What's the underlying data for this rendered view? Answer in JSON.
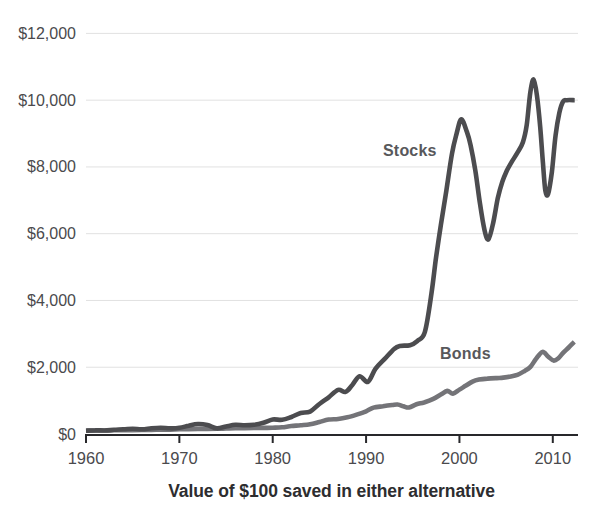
{
  "colors": {
    "background": "#ffffff",
    "stocks_line": "#4c4c4f",
    "bonds_line": "#747478",
    "axis": "#28282b",
    "gridline": "#e1e1e1",
    "tick_text": "#4a4a4d",
    "series_label_text": "#58585b",
    "caption_text": "#2d2d2f"
  },
  "chart_data": {
    "type": "line",
    "title": "Value of $100 saved in either alternative",
    "xlabel": "",
    "ylabel": "",
    "legend_position": "inline-annotations",
    "grid": "horizontal",
    "xlim": [
      1960,
      2012.7
    ],
    "ylim": [
      0,
      12000
    ],
    "x_ticks": [
      {
        "value": 1960,
        "label": "1960"
      },
      {
        "value": 1970,
        "label": "1970"
      },
      {
        "value": 1980,
        "label": "1980"
      },
      {
        "value": 1990,
        "label": "1990"
      },
      {
        "value": 2000,
        "label": "2000"
      },
      {
        "value": 2010,
        "label": "2010"
      }
    ],
    "y_ticks": [
      {
        "value": 0,
        "label": "$0"
      },
      {
        "value": 2000,
        "label": "$2,000"
      },
      {
        "value": 4000,
        "label": "$4,000"
      },
      {
        "value": 6000,
        "label": "$6,000"
      },
      {
        "value": 8000,
        "label": "$8,000"
      },
      {
        "value": 10000,
        "label": "$10,000"
      },
      {
        "value": 12000,
        "label": "$12,000"
      }
    ],
    "series": [
      {
        "name": "Stocks",
        "color": "#4c4c4f",
        "points": [
          [
            1960,
            100
          ],
          [
            1961,
            115
          ],
          [
            1962,
            105
          ],
          [
            1963,
            125
          ],
          [
            1964,
            140
          ],
          [
            1965,
            155
          ],
          [
            1966,
            140
          ],
          [
            1967,
            170
          ],
          [
            1968,
            190
          ],
          [
            1969,
            170
          ],
          [
            1970,
            185
          ],
          [
            1971,
            250
          ],
          [
            1972,
            300
          ],
          [
            1973,
            270
          ],
          [
            1974,
            170
          ],
          [
            1975,
            225
          ],
          [
            1976,
            275
          ],
          [
            1977,
            260
          ],
          [
            1978,
            275
          ],
          [
            1979,
            335
          ],
          [
            1980,
            435
          ],
          [
            1981,
            425
          ],
          [
            1982,
            510
          ],
          [
            1983,
            630
          ],
          [
            1984,
            670
          ],
          [
            1985,
            900
          ],
          [
            1986,
            1100
          ],
          [
            1987,
            1320
          ],
          [
            1987.8,
            1260
          ],
          [
            1988.5,
            1460
          ],
          [
            1989.3,
            1730
          ],
          [
            1990.2,
            1560
          ],
          [
            1991,
            1950
          ],
          [
            1992,
            2250
          ],
          [
            1993,
            2550
          ],
          [
            1993.6,
            2640
          ],
          [
            1994.7,
            2660
          ],
          [
            1995.5,
            2790
          ],
          [
            1996.3,
            3060
          ],
          [
            1997,
            4200
          ],
          [
            1997.5,
            5300
          ],
          [
            1998,
            6250
          ],
          [
            1998.6,
            7300
          ],
          [
            1999.2,
            8400
          ],
          [
            1999.7,
            9000
          ],
          [
            2000.2,
            9430
          ],
          [
            2000.8,
            9050
          ],
          [
            2001.2,
            8650
          ],
          [
            2001.7,
            7900
          ],
          [
            2002.2,
            6900
          ],
          [
            2002.7,
            6100
          ],
          [
            2003.1,
            5830
          ],
          [
            2003.6,
            6300
          ],
          [
            2004.1,
            7050
          ],
          [
            2004.6,
            7560
          ],
          [
            2005.1,
            7900
          ],
          [
            2005.6,
            8150
          ],
          [
            2006.2,
            8420
          ],
          [
            2006.8,
            8740
          ],
          [
            2007.2,
            9250
          ],
          [
            2007.6,
            10250
          ],
          [
            2007.95,
            10620
          ],
          [
            2008.3,
            10150
          ],
          [
            2008.65,
            9200
          ],
          [
            2008.95,
            8100
          ],
          [
            2009.2,
            7300
          ],
          [
            2009.5,
            7190
          ],
          [
            2009.9,
            7850
          ],
          [
            2010.3,
            8950
          ],
          [
            2010.7,
            9620
          ],
          [
            2011.1,
            9960
          ],
          [
            2011.5,
            10000
          ],
          [
            2012.35,
            10000
          ]
        ]
      },
      {
        "name": "Bonds",
        "color": "#747478",
        "points": [
          [
            1960,
            100
          ],
          [
            1961,
            102
          ],
          [
            1962,
            106
          ],
          [
            1963,
            110
          ],
          [
            1964,
            115
          ],
          [
            1965,
            118
          ],
          [
            1966,
            120
          ],
          [
            1967,
            124
          ],
          [
            1968,
            128
          ],
          [
            1969,
            130
          ],
          [
            1970,
            140
          ],
          [
            1971,
            148
          ],
          [
            1972,
            152
          ],
          [
            1973,
            152
          ],
          [
            1974,
            155
          ],
          [
            1975,
            165
          ],
          [
            1976,
            175
          ],
          [
            1977,
            178
          ],
          [
            1978,
            180
          ],
          [
            1979,
            182
          ],
          [
            1980,
            188
          ],
          [
            1981,
            200
          ],
          [
            1982,
            240
          ],
          [
            1983,
            260
          ],
          [
            1984,
            290
          ],
          [
            1985,
            360
          ],
          [
            1986,
            430
          ],
          [
            1987,
            450
          ],
          [
            1988,
            500
          ],
          [
            1989,
            580
          ],
          [
            1990,
            680
          ],
          [
            1990.8,
            790
          ],
          [
            1991.8,
            830
          ],
          [
            1992.8,
            870
          ],
          [
            1993.4,
            885
          ],
          [
            1994,
            830
          ],
          [
            1994.6,
            795
          ],
          [
            1995.4,
            890
          ],
          [
            1996.2,
            945
          ],
          [
            1997.2,
            1050
          ],
          [
            1998,
            1180
          ],
          [
            1998.7,
            1290
          ],
          [
            1999.3,
            1210
          ],
          [
            2000,
            1330
          ],
          [
            2000.7,
            1450
          ],
          [
            2001.4,
            1570
          ],
          [
            2002.1,
            1630
          ],
          [
            2003,
            1660
          ],
          [
            2004,
            1675
          ],
          [
            2004.7,
            1690
          ],
          [
            2005.5,
            1725
          ],
          [
            2006.2,
            1770
          ],
          [
            2007,
            1890
          ],
          [
            2007.6,
            2010
          ],
          [
            2008.2,
            2250
          ],
          [
            2008.9,
            2460
          ],
          [
            2009.5,
            2320
          ],
          [
            2010.1,
            2200
          ],
          [
            2010.6,
            2270
          ],
          [
            2011.1,
            2430
          ],
          [
            2011.7,
            2590
          ],
          [
            2012.3,
            2760
          ]
        ]
      }
    ]
  }
}
